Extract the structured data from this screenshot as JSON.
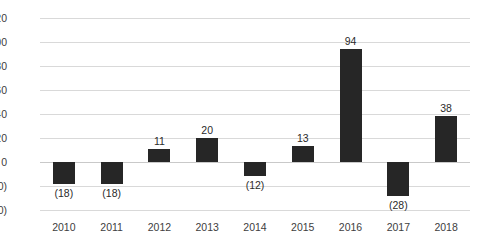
{
  "chart_data": {
    "type": "bar",
    "title": "",
    "subtitle": "",
    "xlabel": "",
    "ylabel": "",
    "categories": [
      "2010",
      "2011",
      "2012",
      "2013",
      "2014",
      "2015",
      "2016",
      "2017",
      "2018"
    ],
    "values": [
      -18,
      -18,
      11,
      20,
      -12,
      13,
      94,
      -28,
      38
    ],
    "point_labels": [
      "(18)",
      "(18)",
      "11",
      "20",
      "(12)",
      "13",
      "94",
      "(28)",
      "38"
    ],
    "ylim": [
      -40,
      120
    ],
    "ytick_values": [
      120,
      100,
      80,
      60,
      40,
      20,
      0,
      -20,
      -40
    ],
    "ytick_labels": [
      "120",
      "100",
      "80",
      "60",
      "40",
      "20",
      "0",
      "(20)",
      "(40)"
    ],
    "grid": true,
    "legend": "none",
    "series": [
      {
        "name": "",
        "values": [
          -18,
          -18,
          11,
          20,
          -12,
          13,
          94,
          -28,
          38
        ]
      }
    ],
    "colors": {
      "bar": "#262626",
      "gridline": "#d9d9d9",
      "zero_line": "#c9c9c9",
      "text": "#404040",
      "background": "#ffffff"
    }
  }
}
